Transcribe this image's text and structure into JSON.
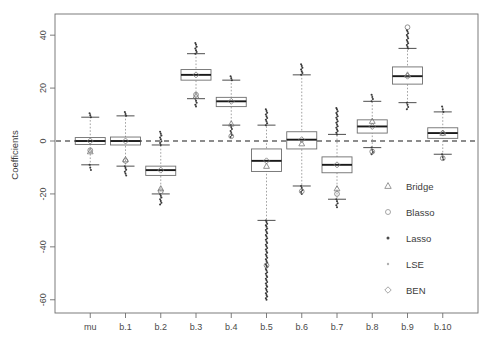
{
  "chart_data": {
    "type": "box",
    "title": "",
    "xlabel": "",
    "ylabel": "Coefficients",
    "ylim": [
      -65,
      48
    ],
    "yticks": [
      40,
      20,
      0,
      -20,
      -40,
      -60
    ],
    "grid": false,
    "zero_reference_line": 0,
    "categories": [
      "mu",
      "b.1",
      "b.2",
      "b.3",
      "b.4",
      "b.5",
      "b.6",
      "b.7",
      "b.8",
      "b.9",
      "b.10"
    ],
    "legend": {
      "position": "bottom-right",
      "entries": [
        {
          "label": "Bridge",
          "marker": "triangle"
        },
        {
          "label": "Blasso",
          "marker": "circle"
        },
        {
          "label": "Lasso",
          "marker": "filled-dot"
        },
        {
          "label": "LSE",
          "marker": "small-dot"
        },
        {
          "label": "BEN",
          "marker": "diamond"
        }
      ]
    },
    "boxes": [
      {
        "category": "mu",
        "min": -11.0,
        "q1": -1.3,
        "median": 0.0,
        "q3": 1.3,
        "max": 10.5,
        "whisker_low": -9.0,
        "whisker_high": 9.0,
        "bridge": -4.0,
        "blasso": -3.5,
        "ben": 0.0
      },
      {
        "category": "b.1",
        "min": -13.0,
        "q1": -1.5,
        "median": 0.0,
        "q3": 1.5,
        "max": 11.0,
        "whisker_low": -9.5,
        "whisker_high": 9.5,
        "bridge": -7.0,
        "blasso": -7.5,
        "ben": 0.0
      },
      {
        "category": "b.2",
        "min": -24.0,
        "q1": -13.0,
        "median": -11.0,
        "q3": -9.5,
        "max": 3.5,
        "whisker_low": -20.0,
        "whisker_high": -1.5,
        "bridge": -18.0,
        "blasso": -19.0,
        "ben": -11.0
      },
      {
        "category": "b.3",
        "min": 13.0,
        "q1": 23.0,
        "median": 25.0,
        "q3": 27.0,
        "max": 37.0,
        "whisker_low": 16.0,
        "whisker_high": 33.0,
        "bridge": 17.0,
        "blasso": 17.5,
        "ben": 25.0
      },
      {
        "category": "b.4",
        "min": 1.5,
        "q1": 13.0,
        "median": 15.0,
        "q3": 16.5,
        "max": 24.5,
        "whisker_low": 6.0,
        "whisker_high": 23.0,
        "bridge": 6.5,
        "blasso": 1.8,
        "ben": 15.0
      },
      {
        "category": "b.5",
        "min": -60.0,
        "q1": -11.5,
        "median": -7.5,
        "q3": -3.0,
        "max": 12.0,
        "whisker_low": -30.0,
        "whisker_high": 6.0,
        "bridge": -9.5,
        "blasso": -47.0,
        "ben": -7.5
      },
      {
        "category": "b.6",
        "min": -20.0,
        "q1": -3.0,
        "median": 0.5,
        "q3": 3.5,
        "max": 29.0,
        "whisker_low": -17.0,
        "whisker_high": 25.0,
        "bridge": -1.0,
        "blasso": -19.0,
        "ben": 0.5
      },
      {
        "category": "b.7",
        "min": -25.0,
        "q1": -12.0,
        "median": -9.0,
        "q3": -6.0,
        "max": 12.5,
        "whisker_low": -22.0,
        "whisker_high": 2.5,
        "bridge": -18.0,
        "blasso": -20.0,
        "ben": -9.0
      },
      {
        "category": "b.8",
        "min": -5.0,
        "q1": 3.0,
        "median": 5.5,
        "q3": 8.0,
        "max": 17.5,
        "whisker_low": -2.5,
        "whisker_high": 15.0,
        "bridge": 7.5,
        "blasso": -4.0,
        "ben": 5.5
      },
      {
        "category": "b.9",
        "min": 12.0,
        "q1": 21.5,
        "median": 24.5,
        "q3": 28.0,
        "max": 42.0,
        "whisker_low": 14.5,
        "whisker_high": 35.0,
        "bridge": 25.0,
        "blasso": 43.0,
        "ben": 24.5
      },
      {
        "category": "b.10",
        "min": -7.0,
        "q1": 1.0,
        "median": 3.0,
        "q3": 5.0,
        "max": 13.0,
        "whisker_low": -5.0,
        "whisker_high": 11.0,
        "bridge": 3.0,
        "blasso": -6.5,
        "ben": 3.0
      }
    ]
  }
}
